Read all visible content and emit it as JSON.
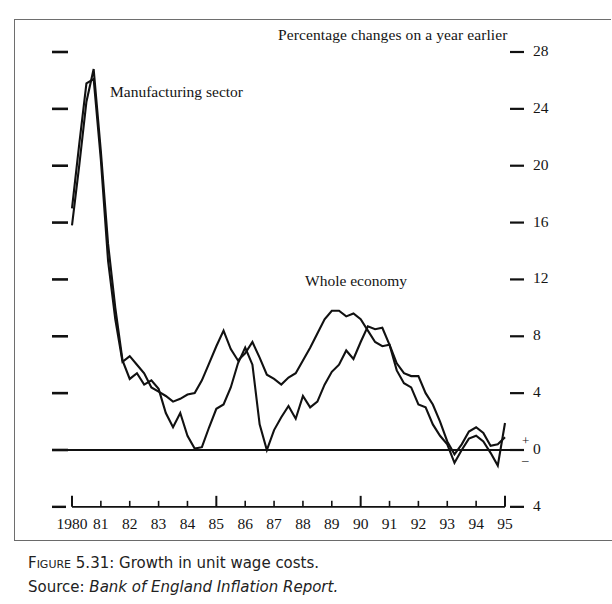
{
  "figure": {
    "caption_prefix": "Figure",
    "caption_number": "5.31:",
    "caption_title": "Growth in unit wage costs.",
    "source_label": "Source:",
    "source_text": "Bank of England Inflation Report."
  },
  "chart_data": {
    "type": "line",
    "title": "Percentage changes on a year earlier",
    "xlabel": "",
    "ylabel": "",
    "grid": false,
    "legend_position": "inline-annotation",
    "xlim": [
      1980,
      1995
    ],
    "ylim": [
      -4,
      28
    ],
    "yticks": [
      -4,
      0,
      4,
      8,
      12,
      16,
      20,
      24,
      28
    ],
    "ytick_labels": [
      "4",
      "0",
      "4",
      "8",
      "12",
      "16",
      "20",
      "24",
      "28"
    ],
    "zero_sign_positive": "+",
    "zero_sign_negative": "–",
    "xticks": [
      1980,
      1981,
      1982,
      1983,
      1984,
      1985,
      1986,
      1987,
      1988,
      1989,
      1990,
      1991,
      1992,
      1993,
      1994,
      1995
    ],
    "xtick_labels": [
      "1980",
      "81",
      "82",
      "83",
      "84",
      "85",
      "86",
      "87",
      "88",
      "89",
      "90",
      "91",
      "92",
      "93",
      "94",
      "95"
    ],
    "line_color": "#111111",
    "axis_color": "#111111",
    "series": [
      {
        "name": "Manufacturing sector",
        "label_position": {
          "x": 1981.3,
          "y": 24.2
        },
        "x": [
          1980.0,
          1980.25,
          1980.5,
          1980.75,
          1981.0,
          1981.25,
          1981.5,
          1981.75,
          1982.0,
          1982.25,
          1982.5,
          1982.75,
          1983.0,
          1983.25,
          1983.5,
          1983.75,
          1984.0,
          1984.25,
          1984.5,
          1984.75,
          1985.0,
          1985.25,
          1985.5,
          1985.75,
          1986.0,
          1986.25,
          1986.5,
          1986.75,
          1987.0,
          1987.25,
          1987.5,
          1987.75,
          1988.0,
          1988.25,
          1988.5,
          1988.75,
          1989.0,
          1989.25,
          1989.5,
          1989.75,
          1990.0,
          1990.25,
          1990.5,
          1990.75,
          1991.0,
          1991.25,
          1991.5,
          1991.75,
          1992.0,
          1992.25,
          1992.5,
          1992.75,
          1993.0,
          1993.25,
          1993.5,
          1993.75,
          1994.0,
          1994.25,
          1994.5,
          1994.75,
          1995.0
        ],
        "y": [
          15.8,
          20.0,
          24.5,
          26.8,
          21.0,
          14.5,
          10.0,
          6.3,
          5.0,
          5.4,
          4.6,
          4.9,
          4.3,
          2.6,
          1.6,
          2.6,
          1.0,
          0.1,
          0.2,
          1.6,
          2.9,
          3.2,
          4.4,
          6.1,
          7.2,
          6.0,
          1.8,
          0.0,
          1.4,
          2.3,
          3.1,
          2.2,
          3.8,
          3.0,
          3.4,
          4.6,
          5.5,
          6.0,
          7.0,
          6.4,
          7.6,
          8.7,
          8.5,
          8.6,
          7.4,
          5.6,
          4.7,
          4.4,
          3.2,
          3.0,
          1.8,
          1.0,
          0.4,
          -0.9,
          0.0,
          0.8,
          1.0,
          0.6,
          -0.2,
          -1.1,
          1.9
        ]
      },
      {
        "name": "Whole economy",
        "label_position": {
          "x": 1988.3,
          "y": 11.2
        },
        "x": [
          1980.0,
          1980.25,
          1980.5,
          1980.75,
          1981.0,
          1981.25,
          1981.5,
          1981.75,
          1982.0,
          1982.25,
          1982.5,
          1982.75,
          1983.0,
          1983.25,
          1983.5,
          1983.75,
          1984.0,
          1984.25,
          1984.5,
          1984.75,
          1985.0,
          1985.25,
          1985.5,
          1985.75,
          1986.0,
          1986.25,
          1986.5,
          1986.75,
          1987.0,
          1987.25,
          1987.5,
          1987.75,
          1988.0,
          1988.25,
          1988.5,
          1988.75,
          1989.0,
          1989.25,
          1989.5,
          1989.75,
          1990.0,
          1990.25,
          1990.5,
          1990.75,
          1991.0,
          1991.25,
          1991.5,
          1991.75,
          1992.0,
          1992.25,
          1992.5,
          1992.75,
          1993.0,
          1993.25,
          1993.5,
          1993.75,
          1994.0,
          1994.25,
          1994.5,
          1994.75,
          1995.0
        ],
        "y": [
          17.0,
          21.5,
          25.8,
          26.1,
          20.4,
          13.3,
          9.2,
          6.2,
          6.6,
          6.0,
          5.4,
          4.4,
          4.1,
          3.8,
          3.4,
          3.6,
          3.9,
          4.0,
          4.9,
          6.1,
          7.3,
          8.4,
          7.1,
          6.3,
          6.8,
          7.6,
          6.5,
          5.3,
          5.0,
          4.6,
          5.1,
          5.4,
          6.3,
          7.2,
          8.2,
          9.2,
          9.8,
          9.8,
          9.4,
          9.6,
          9.2,
          8.4,
          7.6,
          7.3,
          7.4,
          6.1,
          5.4,
          5.2,
          5.2,
          4.0,
          3.2,
          2.0,
          0.6,
          -0.3,
          0.4,
          1.3,
          1.6,
          1.2,
          0.3,
          0.4,
          0.9
        ]
      }
    ]
  }
}
